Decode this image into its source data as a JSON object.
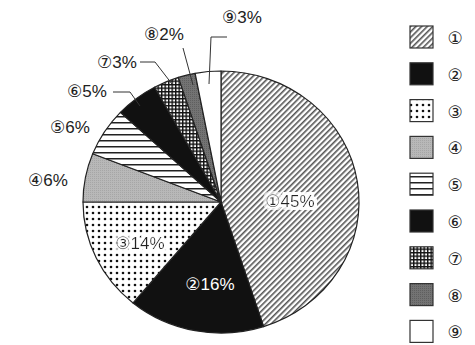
{
  "chart_data": {
    "type": "pie",
    "title": "",
    "start_angle_deg": 0,
    "direction": "clockwise",
    "categories": [
      "①",
      "②",
      "③",
      "④",
      "⑤",
      "⑥",
      "⑦",
      "⑧",
      "⑨"
    ],
    "values": [
      45,
      16,
      14,
      6,
      6,
      5,
      3,
      2,
      3
    ],
    "unit": "%",
    "labels": [
      "①45%",
      "②16%",
      "③14%",
      "④6%",
      "⑤6%",
      "⑥5%",
      "⑦3%",
      "⑧2%",
      "⑨3%"
    ],
    "legend": {
      "position": "right",
      "entries": [
        "①",
        "②",
        "③",
        "④",
        "⑤",
        "⑥",
        "⑦",
        "⑧",
        "⑨"
      ]
    },
    "fills": [
      "diagonal-hatch",
      "solid-black",
      "dots",
      "light-gray-stipple",
      "horizontal-lines",
      "solid-black",
      "crosshatch-grid",
      "dark-gray-stipple",
      "white"
    ]
  },
  "colors": {
    "outline": "#222222",
    "black": "#111111",
    "light_gray": "#b4b4b4",
    "dark_gray": "#6e6e6e",
    "background": "#ffffff"
  }
}
